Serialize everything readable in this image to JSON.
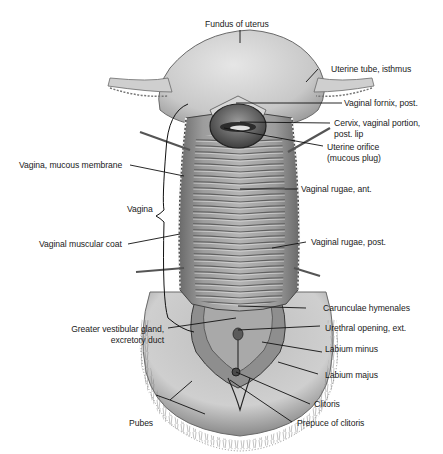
{
  "figure": {
    "labels": {
      "fundus": "Fundus of uterus",
      "uterine_tube": "Uterine tube, isthmus",
      "fornix": "Vaginal fornix, post.",
      "cervix_l1": "Cervix, vaginal portion,",
      "cervix_l2": "post. lip",
      "orifice_l1": "Uterine orifice",
      "orifice_l2": "(mucous plug)",
      "mucous_membrane": "Vagina, mucous membrane",
      "vagina": "Vagina",
      "rugae_ant": "Vaginal rugae, ant.",
      "muscular_coat": "Vaginal muscular coat",
      "rugae_post": "Vaginal rugae, post.",
      "carunculae": "Carunculae hymenales",
      "gland_l1": "Greater vestibular gland,",
      "gland_l2": "excretory duct",
      "urethral": "Urethral opening, ext.",
      "labium_minus": "Labium minus",
      "labium_majus": "Labium majus",
      "clitoris": "Clitoris",
      "pubes": "Pubes",
      "prepuce": "Prepuce of clitoris"
    },
    "colors": {
      "background": "#ffffff",
      "tissue_light": "#d4d4d4",
      "tissue_mid": "#a8a8a8",
      "tissue_dark": "#5a5a5a",
      "leader_line": "#111111"
    }
  }
}
